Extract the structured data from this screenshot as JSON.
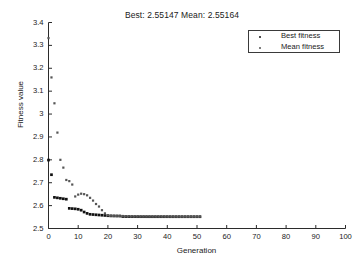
{
  "chart_data": {
    "type": "scatter",
    "title": "Best: 2.55147 Mean: 2.55164",
    "xlabel": "Generation",
    "ylabel": "Fitness value",
    "xlim": [
      0,
      100
    ],
    "ylim": [
      2.5,
      3.4
    ],
    "xticks": [
      0,
      10,
      20,
      30,
      40,
      50,
      60,
      70,
      80,
      90,
      100
    ],
    "yticks": [
      "2.5",
      "2.6",
      "2.7",
      "2.8",
      "2.9",
      "3",
      "3.1",
      "3.2",
      "3.3",
      "3.4"
    ],
    "grid": false,
    "legend_position": "top-right",
    "legend": [
      "Best fitness",
      "Mean fitness"
    ],
    "x": [
      0,
      1,
      2,
      3,
      4,
      5,
      6,
      7,
      8,
      9,
      10,
      11,
      12,
      13,
      14,
      15,
      16,
      17,
      18,
      19,
      20,
      21,
      22,
      23,
      24,
      25,
      26,
      27,
      28,
      29,
      30,
      31,
      32,
      33,
      34,
      35,
      36,
      37,
      38,
      39,
      40,
      41,
      42,
      43,
      44,
      45,
      46,
      47,
      48,
      49,
      50,
      51
    ],
    "series": [
      {
        "name": "Best fitness",
        "color": "#111111",
        "values": [
          2.799,
          2.735,
          2.636,
          2.634,
          2.632,
          2.63,
          2.628,
          2.588,
          2.587,
          2.586,
          2.584,
          2.58,
          2.572,
          2.566,
          2.562,
          2.561,
          2.56,
          2.559,
          2.558,
          2.557,
          2.5558,
          2.5551,
          2.5548,
          2.5546,
          2.5545,
          2.5524,
          2.552,
          2.5518,
          2.5517,
          2.5517,
          2.55165,
          2.5516,
          2.55158,
          2.55155,
          2.55153,
          2.55152,
          2.55151,
          2.5515,
          2.5515,
          2.55149,
          2.55149,
          2.55148,
          2.55148,
          2.55148,
          2.55147,
          2.55147,
          2.55147,
          2.55147,
          2.55147,
          2.55147,
          2.55147,
          2.55147
        ]
      },
      {
        "name": "Mean fitness",
        "color": "#555555",
        "values": [
          3.332,
          3.16,
          3.047,
          2.919,
          2.8,
          2.766,
          2.712,
          2.707,
          2.692,
          2.64,
          2.648,
          2.652,
          2.65,
          2.645,
          2.634,
          2.622,
          2.607,
          2.596,
          2.58,
          2.566,
          2.558,
          2.5556,
          2.5552,
          2.5549,
          2.5548,
          2.5546,
          2.553,
          2.5525,
          2.5522,
          2.552,
          2.5519,
          2.5518,
          2.5518,
          2.5517,
          2.5517,
          2.5517,
          2.55168,
          2.55167,
          2.55166,
          2.55166,
          2.55165,
          2.55165,
          2.55165,
          2.55164,
          2.55164,
          2.55164,
          2.55164,
          2.55164,
          2.55164,
          2.55164,
          2.55164,
          2.55164
        ]
      }
    ]
  },
  "legend": {
    "best_label": "Best fitness",
    "mean_label": "Mean fitness"
  }
}
